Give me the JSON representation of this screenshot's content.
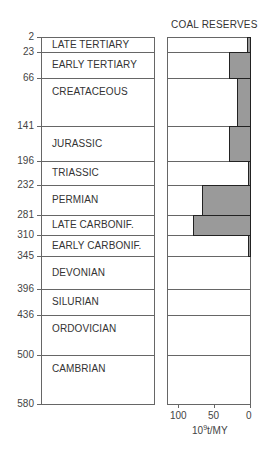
{
  "chart_data": {
    "type": "bar",
    "orientation": "horizontal",
    "title": "COAL RESERVES",
    "xlabel": "10^9t/MY",
    "ylabel": "",
    "xlim": [
      110,
      0
    ],
    "x_ticks": [
      "100",
      "50",
      "0"
    ],
    "y_ticks": [
      "2",
      "23",
      "66",
      "141",
      "196",
      "232",
      "281",
      "310",
      "345",
      "396",
      "436",
      "500",
      "580"
    ],
    "categories": [
      "LATE TERTIARY",
      "EARLY TERTIARY",
      "CREATACEOUS",
      "JURASSIC",
      "TRIASSIC",
      "PERMIAN",
      "LATE CARBONIF.",
      "EARLY CARBONIF.",
      "DEVONIAN",
      "SILURIAN",
      "ORDOVICIAN",
      "CAMBRIAN"
    ],
    "boundaries_my": [
      2,
      23,
      66,
      141,
      196,
      232,
      281,
      310,
      345,
      396,
      436,
      500,
      580
    ],
    "values": [
      5,
      31,
      19,
      31,
      2,
      68,
      80,
      4,
      0,
      0,
      0,
      0
    ],
    "grid": false,
    "legend": null
  },
  "labels": {
    "title": "COAL RESERVES",
    "x_unit_base": "10",
    "x_unit_exp": "9",
    "x_unit_rest": "t/MY",
    "x_ticks": [
      "100",
      "50",
      "0"
    ],
    "y_ticks": [
      "2",
      "23",
      "66",
      "141",
      "196",
      "232",
      "281",
      "310",
      "345",
      "396",
      "436",
      "500",
      "580"
    ],
    "periods": [
      "LATE TERTIARY",
      "EARLY TERTIARY",
      "CREATACEOUS",
      "JURASSIC",
      "TRIASSIC",
      "PERMIAN",
      "LATE CARBONIF.",
      "EARLY CARBONIF.",
      "DEVONIAN",
      "SILURIAN",
      "ORDOVICIAN",
      "CAMBRIAN"
    ]
  }
}
